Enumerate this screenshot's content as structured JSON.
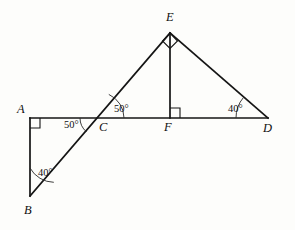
{
  "figure": {
    "background_color": "#fdfdfb",
    "line_color": "#151515",
    "width": 295,
    "height": 230
  },
  "vertices": {
    "A": {
      "label": "A",
      "x": 30,
      "y": 118,
      "label_x": 17,
      "label_y": 113
    },
    "B": {
      "label": "B",
      "x": 30,
      "y": 196,
      "label_x": 24,
      "label_y": 214
    },
    "C": {
      "label": "C",
      "x": 98,
      "y": 118,
      "label_x": 99,
      "label_y": 131
    },
    "D": {
      "label": "D",
      "x": 268,
      "y": 118,
      "label_x": 263,
      "label_y": 132
    },
    "E": {
      "label": "E",
      "x": 170,
      "y": 33,
      "label_x": 166,
      "label_y": 21
    },
    "F": {
      "label": "F",
      "x": 170,
      "y": 118,
      "label_x": 164,
      "label_y": 131
    }
  },
  "segments": [
    {
      "name": "segment-AD",
      "from": "A",
      "to": "D"
    },
    {
      "name": "segment-AB",
      "from": "A",
      "to": "B"
    },
    {
      "name": "segment-BE",
      "from": "B",
      "to": "E"
    },
    {
      "name": "segment-EF",
      "from": "E",
      "to": "F"
    },
    {
      "name": "segment-ED",
      "from": "E",
      "to": "D"
    }
  ],
  "angles": [
    {
      "name": "angle-at-B",
      "vertex": "B",
      "value": "40°",
      "label_x": 38,
      "label_y": 176,
      "marker": "arc"
    },
    {
      "name": "angle-BCA",
      "vertex": "C",
      "value": "50°",
      "label_x": 64,
      "label_y": 128,
      "marker": "arc"
    },
    {
      "name": "angle-ECF",
      "vertex": "C",
      "value": "50°",
      "label_x": 114,
      "label_y": 112,
      "marker": "arc"
    },
    {
      "name": "angle-at-D",
      "vertex": "D",
      "value": "40°",
      "label_x": 228,
      "label_y": 112,
      "marker": "arc"
    }
  ],
  "right_angles": [
    {
      "name": "right-angle-at-A",
      "vertex": "A",
      "symbol": "square"
    },
    {
      "name": "right-angle-at-F",
      "vertex": "F",
      "symbol": "square"
    },
    {
      "name": "right-angle-at-E",
      "vertex": "E",
      "symbol": "square-rotated"
    }
  ]
}
